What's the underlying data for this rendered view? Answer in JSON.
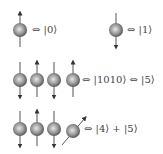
{
  "diagram": {
    "rows": [
      {
        "id": "row-1a",
        "spins": [
          "up"
        ],
        "label": "⇔ |0⟩"
      },
      {
        "id": "row-1b",
        "spins": [
          "down"
        ],
        "label": "⇔ |1⟩"
      },
      {
        "id": "row-2",
        "spins": [
          "down",
          "up",
          "down",
          "up"
        ],
        "label": "⇔ |1010⟩ ⇔ |5⟩"
      },
      {
        "id": "row-3",
        "spins": [
          "down",
          "up",
          "down",
          "tilted"
        ],
        "label": "⇔ |4⟩ + |5⟩"
      }
    ],
    "colors": {
      "sphere_light": "#d8d8d8",
      "sphere_dark": "#555555",
      "arrow": "#333333",
      "text": "#444444"
    }
  }
}
